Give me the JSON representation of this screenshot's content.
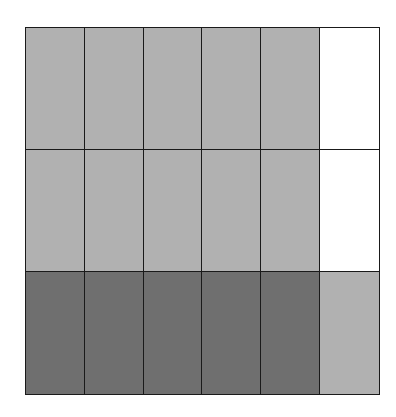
{
  "diagram": {
    "type": "fraction-grid",
    "rows": 3,
    "columns": 6,
    "colors": {
      "light": "#b1b1b1",
      "dark": "#6f6f6f",
      "none": "#ffffff",
      "border": "#1a1a1a"
    },
    "cells": [
      [
        "light",
        "light",
        "light",
        "light",
        "light",
        "none"
      ],
      [
        "light",
        "light",
        "light",
        "light",
        "light",
        "none"
      ],
      [
        "dark",
        "dark",
        "dark",
        "dark",
        "dark",
        "light"
      ]
    ]
  }
}
